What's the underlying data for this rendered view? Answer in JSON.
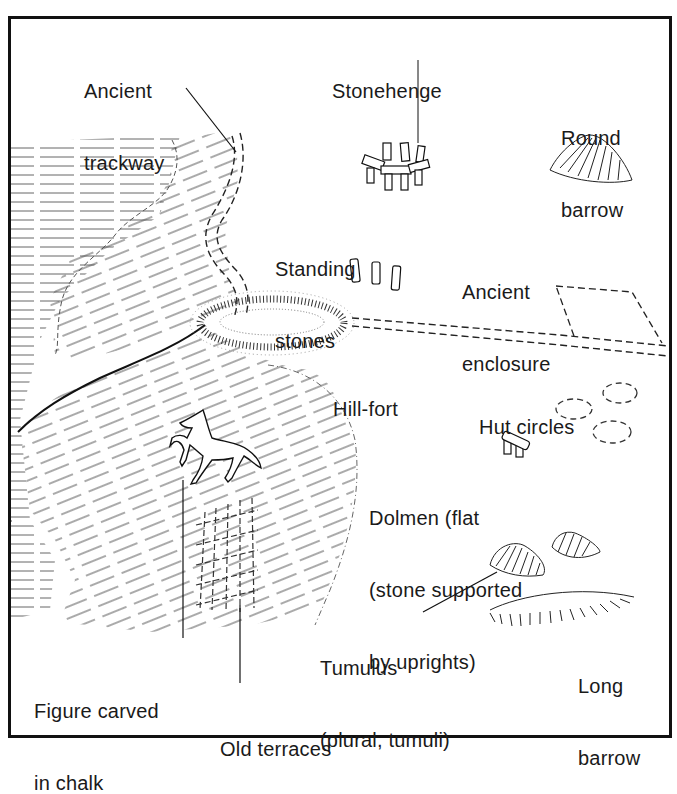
{
  "diagram": {
    "type": "illustrated landscape of ancient/prehistoric features",
    "colors": {
      "ink": "#1a1a1a",
      "background": "#ffffff",
      "hatch": "#444444"
    },
    "labels": {
      "ancient_trackway": {
        "line1": "Ancient",
        "line2": "trackway"
      },
      "stonehenge": {
        "line1": "Stonehenge"
      },
      "round_barrow": {
        "line1": "Round",
        "line2": "barrow"
      },
      "standing_stones": {
        "line1": "Standing",
        "line2": "stones"
      },
      "ancient_enclosure": {
        "line1": "Ancient",
        "line2": "enclosure"
      },
      "hill_fort": {
        "line1": "Hill-fort"
      },
      "hut_circles": {
        "line1": "Hut circles"
      },
      "dolmen": {
        "line1": "Dolmen (flat",
        "line2": "(stone supported",
        "line3": "by uprights)"
      },
      "tumulus": {
        "line1": "Tumulus",
        "line2": "(plural, tumuli)"
      },
      "long_barrow": {
        "line1": "Long",
        "line2": "barrow"
      },
      "figure_carved": {
        "line1": "Figure carved",
        "line2": "in chalk"
      },
      "old_terraces": {
        "line1": "Old terraces"
      }
    }
  }
}
